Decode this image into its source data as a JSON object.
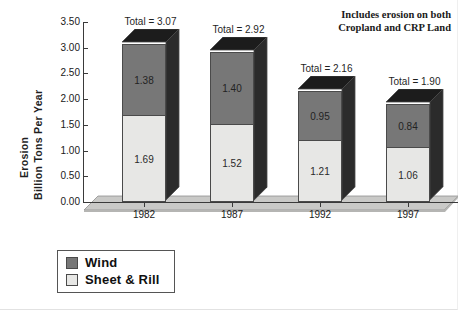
{
  "chart_data": {
    "type": "bar",
    "subtype": "stacked-column-3d",
    "title": "",
    "xlabel": "",
    "ylabel_lines": [
      "Erosion",
      "Billion Tons Per Year"
    ],
    "categories": [
      "1982",
      "1987",
      "1992",
      "1997"
    ],
    "series": [
      {
        "name": "Wind",
        "values": [
          1.38,
          1.4,
          0.95,
          0.84
        ],
        "color": "#777777"
      },
      {
        "name": "Sheet & Rill",
        "values": [
          1.69,
          1.52,
          1.21,
          1.06
        ],
        "color": "#E7E7E5"
      }
    ],
    "value_labels": {
      "wind": [
        "1.38",
        "1.40",
        "0.95",
        "0.84"
      ],
      "sheet_rill": [
        "1.69",
        "1.52",
        "1.21",
        "1.06"
      ]
    },
    "totals": [
      "Total = 3.07",
      "Total = 2.92",
      "Total = 2.16",
      "Total = 1.90"
    ],
    "total_values": [
      3.07,
      2.92,
      2.16,
      1.9
    ],
    "ylim": [
      0.0,
      3.5
    ],
    "ytick_step": 0.5,
    "ytick_labels": [
      "3.50",
      "3.00",
      "2.50",
      "2.00",
      "1.50",
      "1.00",
      "0.50",
      "0.00"
    ],
    "ytick_values": [
      3.5,
      3.0,
      2.5,
      2.0,
      1.5,
      1.0,
      0.5,
      0.0
    ],
    "grid": false,
    "legend_position": "below-left",
    "annotation_lines": [
      "Includes erosion on both",
      "Cropland and CRP Land"
    ]
  },
  "axis": {
    "y_title_line1": "Erosion",
    "y_title_line2": "Billion Tons Per Year"
  },
  "annotation": {
    "line1": "Includes erosion on both",
    "line2": "Cropland and CRP Land"
  },
  "legend": {
    "items": [
      {
        "label": "Wind"
      },
      {
        "label": "Sheet & Rill"
      }
    ]
  },
  "colors": {
    "wind": "#777777",
    "sheet_rill": "#E7E7E5",
    "bar_outline": "#4A4A4A",
    "bar_side": "#2B2B2B",
    "bar_top": "#1C1C1C",
    "floor": "#C9C9C7",
    "axis": "#3A3A3A",
    "text": "#1A1A1A",
    "background": "#FFFFFF"
  }
}
